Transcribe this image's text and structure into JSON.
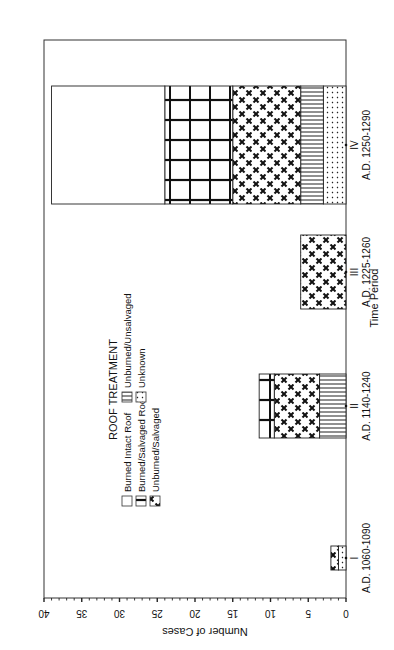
{
  "chart_data": {
    "type": "bar",
    "stacked": true,
    "orientation": "vertical (page rotated 90° counter-clockwise)",
    "title": "",
    "xlabel": "Time Period",
    "ylabel": "Number of Cases",
    "ylim": [
      0,
      40
    ],
    "yticks": [
      0,
      5,
      10,
      15,
      20,
      25,
      30,
      35,
      40
    ],
    "grid": false,
    "legend_title": "ROOF TREATMENT",
    "legend_position": "upper-left inside plot",
    "categories": [
      "I\nA.D. 1060-1090",
      "II\nA.D. 1140-1240",
      "III\nA.D. 1225-1260",
      "IV\nA.D. 1250-1290"
    ],
    "category_numerals": [
      "I",
      "II",
      "III",
      "IV"
    ],
    "category_dates": [
      "A.D. 1060-1090",
      "A.D. 1140-1240",
      "A.D. 1225-1260",
      "A.D. 1250-1290"
    ],
    "series": [
      {
        "name": "Unknown",
        "pattern": "dots",
        "values": [
          1,
          0,
          0,
          3
        ]
      },
      {
        "name": "Unburned/Unsalvaged",
        "pattern": "vertical-lines",
        "values": [
          0,
          3.5,
          0,
          3
        ]
      },
      {
        "name": "Unburned/Salvaged",
        "pattern": "x-cross",
        "values": [
          1,
          6,
          6,
          9
        ]
      },
      {
        "name": "Burned/Salvaged Roof",
        "pattern": "grid",
        "values": [
          0,
          2,
          0,
          9
        ]
      },
      {
        "name": "Burned Intact Roof",
        "pattern": "blank",
        "values": [
          0,
          0,
          0,
          15
        ]
      }
    ],
    "totals": [
      2,
      11.5,
      6,
      39
    ]
  },
  "labels": {
    "ylabel": "Number of Cases",
    "xlabel": "Time Period",
    "legend_title": "ROOF TREATMENT",
    "legend": {
      "burned_intact": "Burned Intact Roof",
      "burned_salvaged": "Burned/Salvaged Roof",
      "unburned_salvaged": "Unburned/Salvaged",
      "unburned_unsalvaged": "Unburned/Unsalvaged",
      "unknown": "Unknown"
    }
  }
}
